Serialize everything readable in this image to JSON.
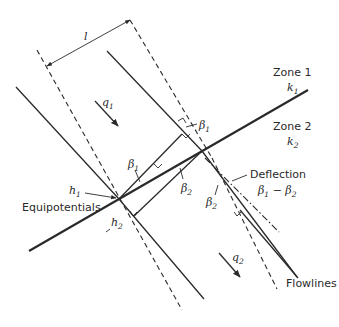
{
  "diagram": {
    "type": "refraction of flowlines at a permeability boundary",
    "zones": [
      {
        "label": "Zone 1",
        "conductivity_symbol": "k",
        "conductivity_sub": "1"
      },
      {
        "label": "Zone 2",
        "conductivity_symbol": "k",
        "conductivity_sub": "2"
      }
    ],
    "flows": [
      {
        "symbol": "q",
        "sub": "1"
      },
      {
        "symbol": "q",
        "sub": "2"
      }
    ],
    "heads": [
      {
        "symbol": "h",
        "sub": "1"
      },
      {
        "symbol": "h",
        "sub": "2"
      }
    ],
    "angles": {
      "beta1": {
        "symbol": "β",
        "sub": "1"
      },
      "beta2": {
        "symbol": "β",
        "sub": "2"
      },
      "deflection_expr": {
        "a": "β",
        "a_sub": "1",
        "op": " − ",
        "b": "β",
        "b_sub": "2"
      }
    },
    "dimension_label": "l",
    "labels": {
      "equipotentials": "Equipotentials",
      "flowlines": "Flowlines",
      "deflection": "Deflection"
    },
    "colors": {
      "ink": "#2a2a2a",
      "background": "#ffffff"
    }
  }
}
